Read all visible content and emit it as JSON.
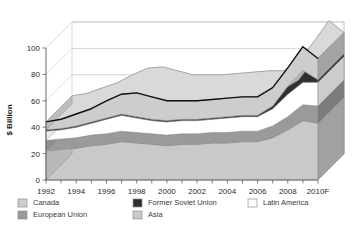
{
  "chart_data": {
    "type": "area",
    "title": "",
    "subtitle": "",
    "xlabel": "",
    "ylabel": "$ Billion",
    "stacked": true,
    "grid": true,
    "three_d": true,
    "legend_position": "bottom",
    "ylim": [
      0,
      100
    ],
    "y_ticks": [
      "0",
      "20",
      "40",
      "60",
      "80",
      "100"
    ],
    "y_tick_values": [
      0,
      20,
      40,
      60,
      80,
      100
    ],
    "x": [
      1992,
      1993,
      1994,
      1995,
      1996,
      1997,
      1998,
      1999,
      2000,
      2001,
      2002,
      2003,
      2004,
      2005,
      2006,
      2007,
      2008,
      2009,
      2010
    ],
    "x_tick_labels": [
      "1992",
      "1994",
      "1996",
      "1998",
      "2000",
      "2002",
      "2004",
      "2006",
      "2008",
      "2010F"
    ],
    "x_tick_values": [
      1992,
      1994,
      1996,
      1998,
      2000,
      2002,
      2004,
      2006,
      2008,
      2010
    ],
    "series": [
      {
        "name": "Asia",
        "color": "#c9c9c9",
        "values": [
          22,
          23,
          24,
          26,
          27,
          29,
          28,
          27,
          26,
          27,
          27,
          28,
          28,
          29,
          29,
          32,
          38,
          45,
          43
        ]
      },
      {
        "name": "European Union",
        "color": "#9a9a9a",
        "values": [
          8,
          8,
          8,
          8,
          8,
          8,
          8,
          8,
          8,
          8,
          8,
          8,
          8,
          8,
          8,
          9,
          10,
          12,
          13
        ]
      },
      {
        "name": "Latin America",
        "color": "#ffffff",
        "values": [
          7,
          7,
          8,
          9,
          11,
          12,
          11,
          10,
          10,
          10,
          10,
          10,
          11,
          11,
          11,
          13,
          17,
          17,
          18
        ]
      },
      {
        "name": "Former Soviet Union",
        "color": "#2f2f2f",
        "values": [
          1,
          1,
          1,
          1,
          1,
          1,
          1,
          1,
          1,
          1,
          1,
          1,
          1,
          1,
          1,
          2,
          6,
          9,
          2
        ]
      },
      {
        "name": "Canada",
        "color": "#cdcdcd",
        "values": [
          6,
          7,
          9,
          10,
          13,
          15,
          18,
          17,
          15,
          14,
          14,
          14,
          14,
          14,
          14,
          14,
          14,
          18,
          16
        ]
      }
    ],
    "totals": [
      44,
      46,
      50,
      54,
      60,
      65,
      66,
      63,
      60,
      60,
      60,
      61,
      62,
      63,
      63,
      70,
      85,
      101,
      92
    ]
  },
  "legend": {
    "items": [
      {
        "label": "Canada",
        "color": "#cdcdcd"
      },
      {
        "label": "European Union",
        "color": "#9a9a9a"
      },
      {
        "label": "Former Soviet Union",
        "color": "#2f2f2f"
      },
      {
        "label": "Asia",
        "color": "#c9c9c9"
      },
      {
        "label": "Latin America",
        "color": "#ffffff"
      }
    ]
  }
}
